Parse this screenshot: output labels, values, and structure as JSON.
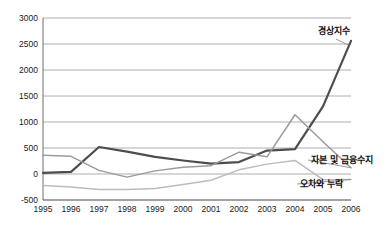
{
  "chart_data": {
    "type": "line",
    "title": "",
    "subtitle": "",
    "xlabel": "",
    "ylabel": "",
    "categories": [
      "1995",
      "1996",
      "1997",
      "1998",
      "1999",
      "2000",
      "2001",
      "2002",
      "2003",
      "2004",
      "2005",
      "2006"
    ],
    "ylim": [
      -500,
      3000
    ],
    "yticks": [
      "3000",
      "2500",
      "2000",
      "1500",
      "1000",
      "500",
      "0",
      "-500"
    ],
    "ytick_values": [
      3000,
      2500,
      2000,
      1500,
      1000,
      500,
      0,
      -500
    ],
    "grid": true,
    "legend_position": "inline-right-labels",
    "series": [
      {
        "name": "경상지수",
        "color": "#4d4d4d",
        "width": 2.2,
        "label_anchor_year": "2006",
        "values": [
          20,
          40,
          520,
          430,
          330,
          260,
          200,
          230,
          450,
          480,
          1300,
          2560
        ]
      },
      {
        "name": "자본 및 금융수지",
        "color": "#9b9b9b",
        "width": 1.5,
        "label_anchor_year": "2006",
        "values": [
          360,
          340,
          70,
          -60,
          60,
          130,
          160,
          420,
          330,
          1140,
          620,
          120
        ]
      },
      {
        "name": "오차와 누락",
        "color": "#bcbcbc",
        "width": 1.5,
        "label_anchor_year": "2006",
        "values": [
          -220,
          -250,
          -300,
          -300,
          -280,
          -200,
          -120,
          80,
          190,
          260,
          -110,
          -105
        ]
      }
    ],
    "annotations": [
      {
        "name": "경상지수",
        "x": 334,
        "y": 34
      },
      {
        "name": "자본 및 금융수지",
        "x": 311,
        "y": 163
      },
      {
        "name": "오차와 누락",
        "x": 300,
        "y": 187
      }
    ]
  }
}
